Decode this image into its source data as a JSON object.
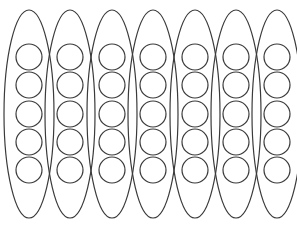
{
  "figure": {
    "canvas": {
      "width": 297,
      "height": 230,
      "background_color": "#ffffff"
    },
    "style": {
      "outline_color": "#3a3a3a",
      "outline_width": 1.2,
      "circle_color": "#3a3a3a",
      "circle_width": 1.2,
      "fill": "none"
    },
    "counts": {
      "ellipse_count": 7,
      "circles_per_ellipse": 5,
      "total_circles": 35
    },
    "ellipse_geometry": {
      "rx": 25,
      "ry": 104,
      "center_y": 114,
      "first_center_x": 29,
      "spacing_x": 41.3,
      "top_y": 10,
      "bottom_y": 218
    },
    "circle_geometry": {
      "r": 13,
      "row_centers_y": [
        57,
        85,
        114,
        142,
        170
      ]
    },
    "ellipses": [
      {
        "index": 1,
        "name": "ellipse-1",
        "center_x": 29,
        "circles": [
          {
            "index": 1,
            "cx": 29,
            "cy": 57
          },
          {
            "index": 2,
            "cx": 29,
            "cy": 85
          },
          {
            "index": 3,
            "cx": 29,
            "cy": 114
          },
          {
            "index": 4,
            "cx": 29,
            "cy": 142
          },
          {
            "index": 5,
            "cx": 29,
            "cy": 170
          }
        ]
      },
      {
        "index": 2,
        "name": "ellipse-2",
        "center_x": 70,
        "circles": [
          {
            "index": 1,
            "cx": 70,
            "cy": 57
          },
          {
            "index": 2,
            "cx": 70,
            "cy": 85
          },
          {
            "index": 3,
            "cx": 70,
            "cy": 114
          },
          {
            "index": 4,
            "cx": 70,
            "cy": 142
          },
          {
            "index": 5,
            "cx": 70,
            "cy": 170
          }
        ]
      },
      {
        "index": 3,
        "name": "ellipse-3",
        "center_x": 112,
        "circles": [
          {
            "index": 1,
            "cx": 112,
            "cy": 57
          },
          {
            "index": 2,
            "cx": 112,
            "cy": 85
          },
          {
            "index": 3,
            "cx": 112,
            "cy": 114
          },
          {
            "index": 4,
            "cx": 112,
            "cy": 142
          },
          {
            "index": 5,
            "cx": 112,
            "cy": 170
          }
        ]
      },
      {
        "index": 4,
        "name": "ellipse-4",
        "center_x": 153,
        "circles": [
          {
            "index": 1,
            "cx": 153,
            "cy": 57
          },
          {
            "index": 2,
            "cx": 153,
            "cy": 85
          },
          {
            "index": 3,
            "cx": 153,
            "cy": 114
          },
          {
            "index": 4,
            "cx": 153,
            "cy": 142
          },
          {
            "index": 5,
            "cx": 153,
            "cy": 170
          }
        ]
      },
      {
        "index": 5,
        "name": "ellipse-5",
        "center_x": 195,
        "circles": [
          {
            "index": 1,
            "cx": 195,
            "cy": 57
          },
          {
            "index": 2,
            "cx": 195,
            "cy": 85
          },
          {
            "index": 3,
            "cx": 195,
            "cy": 114
          },
          {
            "index": 4,
            "cx": 195,
            "cy": 142
          },
          {
            "index": 5,
            "cx": 195,
            "cy": 170
          }
        ]
      },
      {
        "index": 6,
        "name": "ellipse-6",
        "center_x": 236,
        "circles": [
          {
            "index": 1,
            "cx": 236,
            "cy": 57
          },
          {
            "index": 2,
            "cx": 236,
            "cy": 85
          },
          {
            "index": 3,
            "cx": 236,
            "cy": 114
          },
          {
            "index": 4,
            "cx": 236,
            "cy": 142
          },
          {
            "index": 5,
            "cx": 236,
            "cy": 170
          }
        ]
      },
      {
        "index": 7,
        "name": "ellipse-7",
        "center_x": 277,
        "circles": [
          {
            "index": 1,
            "cx": 277,
            "cy": 57
          },
          {
            "index": 2,
            "cx": 277,
            "cy": 85
          },
          {
            "index": 3,
            "cx": 277,
            "cy": 114
          },
          {
            "index": 4,
            "cx": 277,
            "cy": 142
          },
          {
            "index": 5,
            "cx": 277,
            "cy": 170
          }
        ]
      }
    ]
  }
}
